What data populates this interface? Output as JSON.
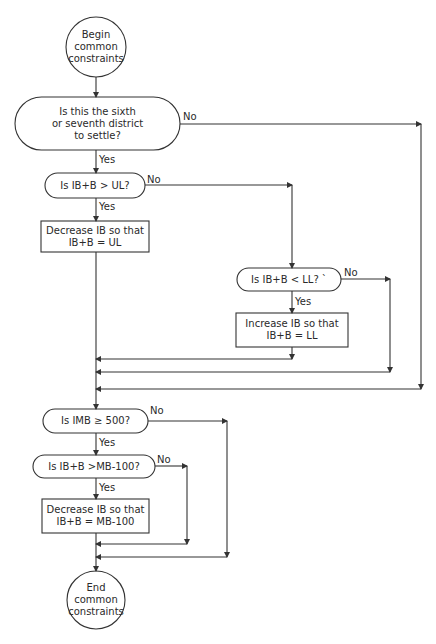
{
  "diagram": {
    "type": "flowchart",
    "colors": {
      "stroke": "#333333",
      "text": "#2a2a2a",
      "background": "#ffffff"
    },
    "nodes": {
      "begin": {
        "shape": "circle",
        "label": "Begin\ncommon\nconstraints"
      },
      "q_district": {
        "shape": "terminal-decision",
        "label": "Is this the sixth\nor seventh district\nto settle?"
      },
      "q_ul": {
        "shape": "terminal-decision",
        "label": "Is IB+B > UL?"
      },
      "dec_ul": {
        "shape": "process",
        "label": "Decrease IB so that\nIB+B = UL"
      },
      "q_ll": {
        "shape": "terminal-decision",
        "label": "Is IB+B < LL? `"
      },
      "inc_ll": {
        "shape": "process",
        "label": "Increase IB so that\nIB+B = LL"
      },
      "q_imb": {
        "shape": "terminal-decision",
        "label": "Is IMB ≥ 500?"
      },
      "q_mb": {
        "shape": "terminal-decision",
        "label": "Is IB+B >MB-100?"
      },
      "dec_mb": {
        "shape": "process",
        "label": "Decrease IB so that\nIB+B = MB-100"
      },
      "end": {
        "shape": "circle",
        "label": "End\ncommon\nconstraints"
      }
    },
    "edge_labels": {
      "district_no": "No",
      "district_yes": "Yes",
      "ul_no": "No",
      "ul_yes": "Yes",
      "ll_no": "No",
      "ll_yes": "Yes",
      "imb_no": "No",
      "imb_yes": "Yes",
      "mb_no": "No",
      "mb_yes": "Yes"
    },
    "edges": [
      {
        "from": "begin",
        "to": "q_district"
      },
      {
        "from": "q_district",
        "to": "q_ul",
        "label": "Yes"
      },
      {
        "from": "q_district",
        "to": "merge_1",
        "label": "No"
      },
      {
        "from": "q_ul",
        "to": "dec_ul",
        "label": "Yes"
      },
      {
        "from": "q_ul",
        "to": "q_ll",
        "label": "No"
      },
      {
        "from": "q_ll",
        "to": "inc_ll",
        "label": "Yes"
      },
      {
        "from": "q_ll",
        "to": "merge_1",
        "label": "No"
      },
      {
        "from": "dec_ul",
        "to": "merge_1"
      },
      {
        "from": "inc_ll",
        "to": "merge_1"
      },
      {
        "from": "merge_1",
        "to": "q_imb"
      },
      {
        "from": "q_imb",
        "to": "q_mb",
        "label": "Yes"
      },
      {
        "from": "q_imb",
        "to": "merge_2",
        "label": "No"
      },
      {
        "from": "q_mb",
        "to": "dec_mb",
        "label": "Yes"
      },
      {
        "from": "q_mb",
        "to": "merge_2",
        "label": "No"
      },
      {
        "from": "dec_mb",
        "to": "merge_2"
      },
      {
        "from": "merge_2",
        "to": "end"
      }
    ]
  }
}
